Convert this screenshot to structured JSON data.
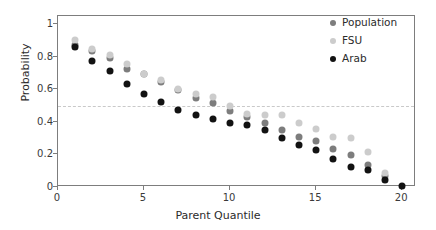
{
  "chart_data": {
    "type": "scatter",
    "title": "",
    "xlabel": "Parent Quantile",
    "ylabel": "Probability",
    "xlim": [
      0,
      20.8
    ],
    "ylim": [
      0,
      1.05
    ],
    "xticks": [
      0,
      5,
      10,
      15,
      20
    ],
    "xtick_labels": [
      "0",
      "5",
      "10",
      "15",
      "20"
    ],
    "yticks": [
      0,
      0.2,
      0.4,
      0.6,
      0.8,
      1
    ],
    "ytick_labels": [
      "0",
      "0.2",
      "0.4",
      "0.6",
      "0.8",
      "1"
    ],
    "grid": false,
    "legend_position": "top-right",
    "reference_lines": [
      {
        "orientation": "horizontal",
        "value": 0.5,
        "style": "dashed",
        "color": "#c9c9c9"
      }
    ],
    "x": [
      1,
      2,
      3,
      4,
      5,
      6,
      7,
      8,
      9,
      10,
      11,
      12,
      13,
      14,
      15,
      16,
      17,
      18,
      19,
      20
    ],
    "series": [
      {
        "name": "Population",
        "color": "#7d7d7d",
        "values": [
          0.875,
          0.835,
          0.795,
          0.725,
          0.695,
          0.645,
          0.595,
          0.545,
          0.515,
          0.465,
          0.43,
          0.395,
          0.35,
          0.31,
          0.28,
          0.235,
          0.195,
          0.135,
          0.065,
          null
        ]
      },
      {
        "name": "FSU",
        "color": "#cccccc",
        "values": [
          0.9,
          0.845,
          0.81,
          0.755,
          0.695,
          0.655,
          0.6,
          0.57,
          0.555,
          0.5,
          0.45,
          0.445,
          0.44,
          0.395,
          0.355,
          0.31,
          0.3,
          0.215,
          0.085,
          null
        ]
      },
      {
        "name": "Arab",
        "color": "#121212",
        "values": [
          0.86,
          0.775,
          0.71,
          0.635,
          0.57,
          0.525,
          0.475,
          0.44,
          0.415,
          0.39,
          0.38,
          0.35,
          0.3,
          0.26,
          0.225,
          0.175,
          0.125,
          0.105,
          0.04,
          0.005
        ]
      }
    ]
  },
  "legend": {
    "entries": [
      {
        "label": "Population",
        "color": "#7d7d7d",
        "marker": "circle-marker"
      },
      {
        "label": "FSU",
        "color": "#cccccc",
        "marker": "circle-marker"
      },
      {
        "label": "Arab",
        "color": "#121212",
        "marker": "circle-marker"
      }
    ]
  }
}
